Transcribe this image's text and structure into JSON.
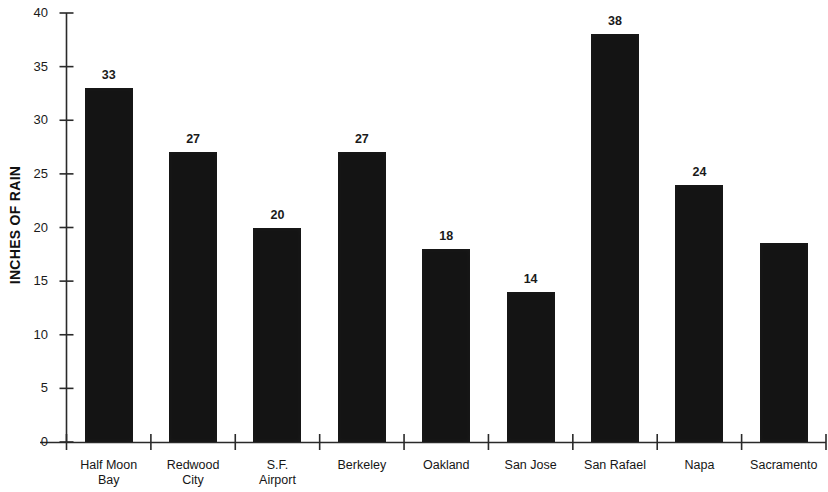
{
  "chart_data": {
    "type": "bar",
    "title": "",
    "xlabel": "",
    "ylabel": "INCHES OF RAIN",
    "ylim": [
      0,
      40
    ],
    "yticks": [
      0,
      5,
      10,
      15,
      20,
      25,
      30,
      35,
      40
    ],
    "ytick_labels": [
      "0",
      "5",
      "10",
      "15",
      "20",
      "25",
      "30",
      "35",
      "40"
    ],
    "grid": false,
    "legend": null,
    "bar_color": "#141414",
    "categories": [
      "Half Moon\nBay",
      "Redwood\nCity",
      "S.F.\nAirport",
      "Berkeley",
      "Oakland",
      "San Jose",
      "San Rafael",
      "Napa",
      "Sacramento"
    ],
    "values": [
      33,
      27,
      20,
      27,
      18,
      14,
      38,
      24,
      18.6
    ],
    "data_labels": [
      "33",
      "27",
      "20",
      "27",
      "18",
      "14",
      "38",
      "24",
      ""
    ]
  },
  "axis": {
    "y_title": "INCHES OF RAIN"
  }
}
